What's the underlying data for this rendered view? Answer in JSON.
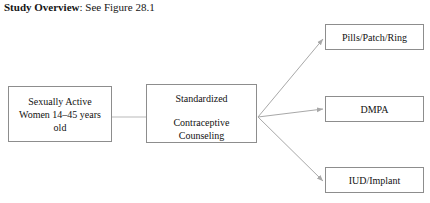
{
  "caption": {
    "lead": "Study Overview",
    "rest": ": See Figure 28.1"
  },
  "diagram": {
    "nodes": {
      "population": {
        "lines": [
          "Sexually Active",
          "Women 14–45 years",
          "old"
        ]
      },
      "intervention": {
        "lines": [
          "Standardized",
          "Contraceptive",
          "Counseling"
        ]
      },
      "outcome_pills": {
        "label": "Pills/Patch/Ring"
      },
      "outcome_dmpa": {
        "label": "DMPA"
      },
      "outcome_iud": {
        "label": "IUD/Implant"
      }
    },
    "colors": {
      "box_border": "#8d8d8d",
      "connector": "#b9b9b9",
      "arrow": "#a8a8a8",
      "text": "#121212",
      "background": "#ffffff"
    }
  }
}
